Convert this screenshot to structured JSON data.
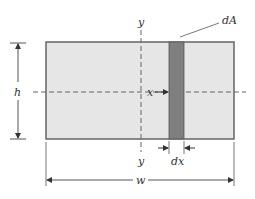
{
  "figure": {
    "labels": {
      "y_top": "y",
      "y_bottom": "y",
      "x": "x",
      "h": "h",
      "w": "w",
      "dx": "dx",
      "dA": "dA"
    },
    "colors": {
      "rect_fill": "#e6e6e6",
      "rect_stroke": "#666666",
      "strip_fill": "#7f7f7f",
      "line": "#555555"
    }
  }
}
